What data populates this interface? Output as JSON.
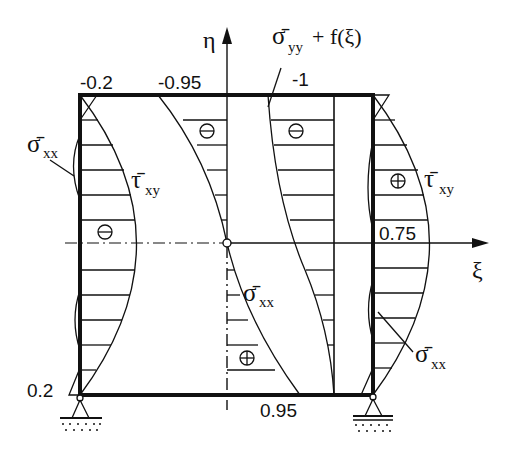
{
  "diagram": {
    "type": "stress-distribution-plate",
    "axes": {
      "vertical_label": "η",
      "horizontal_label": "ξ"
    },
    "labels": {
      "sigma_yy_label_base": "σ̄",
      "sigma_yy_sub": "yy",
      "sigma_yy_suffix": "+ f(ξ)",
      "sigma_xx_base": "σ̄",
      "sigma_xx_sub": "xx",
      "tau_xy_base": "τ̄",
      "tau_xy_sub": "xy"
    },
    "values": {
      "top_left": "-0.2",
      "top_middle": "-0.95",
      "top_right": "-1",
      "bottom_left": "0.2",
      "bottom_middle": "0.95",
      "right_mid": "0.75"
    },
    "signs": {
      "minus": "−",
      "plus": "+"
    },
    "supports": [
      "pinned-left",
      "roller-right"
    ],
    "colors": {
      "line": "#111111",
      "background": "#ffffff"
    }
  }
}
